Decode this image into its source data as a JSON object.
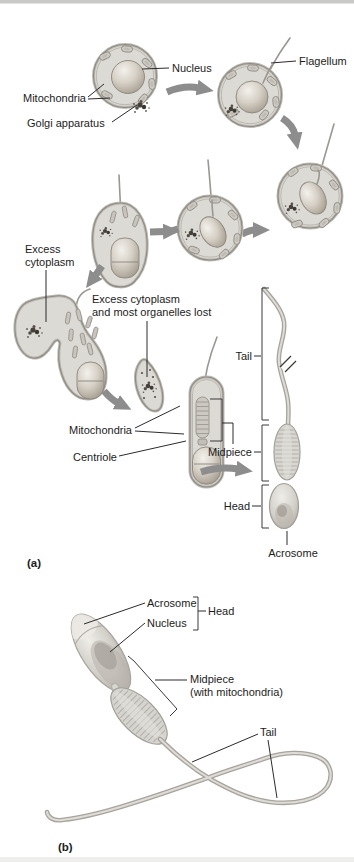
{
  "figure": {
    "panel_a_tag": "(a)",
    "panel_b_tag": "(b)"
  },
  "a": {
    "nucleus": "Nucleus",
    "flagellum": "Flagellum",
    "mitochondria": "Mitochondria",
    "golgi": "Golgi apparatus",
    "excess1": "Excess",
    "excess2": "cytoplasm",
    "lost1": "Excess cytoplasm",
    "lost2": "and most organelles lost",
    "mitochondria2": "Mitochondria",
    "centriole": "Centriole",
    "tail": "Tail",
    "midpiece": "Midpiece",
    "head": "Head",
    "acrosome": "Acrosome"
  },
  "b": {
    "acrosome": "Acrosome",
    "nucleus": "Nucleus",
    "head": "Head",
    "midpiece1": "Midpiece",
    "midpiece2": "(with mitochondria)",
    "tail": "Tail"
  },
  "colors": {
    "background": "#ffffff",
    "ink": "#1c1c1c",
    "leader_line": "#2b2b2b",
    "arrow_gray": "#8d8d8d",
    "cell_fill": "#dcdad5",
    "cell_outline": "#8f8b84",
    "nucleus_shade": "#a89f92",
    "organelle_dark": "#46413b"
  }
}
